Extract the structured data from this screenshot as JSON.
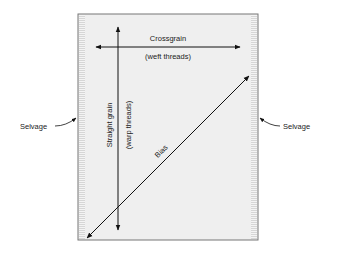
{
  "diagram": {
    "labels": {
      "crossgrain": "Crossgrain",
      "weft": "(weft threads)",
      "straight_grain": "Straight grain",
      "warp": "(warp threads)",
      "bias": "Bias",
      "selvage_left": "Selvage",
      "selvage_right": "Selvage"
    },
    "colors": {
      "fabric_fill": "#efefef",
      "selvage_stripe": "#d8d8d8",
      "border": "#777777",
      "arrow": "#111111"
    }
  }
}
